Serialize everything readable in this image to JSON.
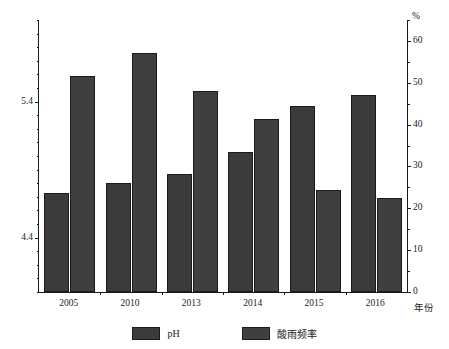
{
  "chart_data": {
    "type": "bar",
    "title": "",
    "xlabel": "年份",
    "ylabel": "",
    "categories": [
      "2005",
      "2010",
      "2013",
      "2014",
      "2015",
      "2016"
    ],
    "series": [
      {
        "name": "pH",
        "axis": "left",
        "color": "#3b3b3b",
        "values": [
          4.73,
          4.8,
          4.87,
          5.03,
          5.37,
          5.45
        ]
      },
      {
        "name": "酸雨频率",
        "axis": "right",
        "color": "#3f3f3f",
        "values": [
          51.7,
          57.0,
          48.1,
          41.4,
          24.3,
          22.4
        ]
      }
    ],
    "left_axis": {
      "label": "",
      "min": 4.0,
      "max": 6.0,
      "step": 0.2,
      "minor_step": 0.1,
      "ticks": [
        "4.0",
        "4.2",
        "4.4",
        "4.6",
        "4.8",
        "5.0",
        "5.2",
        "5.4",
        "5.6",
        "5.8",
        "6.0"
      ]
    },
    "right_axis": {
      "unit": "%",
      "min": 0,
      "max": 65,
      "step": 10,
      "minor_step": 5,
      "ticks": [
        "0",
        "10",
        "20",
        "30",
        "40",
        "50",
        "60"
      ]
    },
    "grid": false,
    "legend_position": "bottom",
    "legend": [
      {
        "label": "pH",
        "color": "#3b3b3b"
      },
      {
        "label": "酸雨频率",
        "color": "#3f3f3f"
      }
    ]
  },
  "axis_unit_percent": "%",
  "axis_label_year": "年份"
}
